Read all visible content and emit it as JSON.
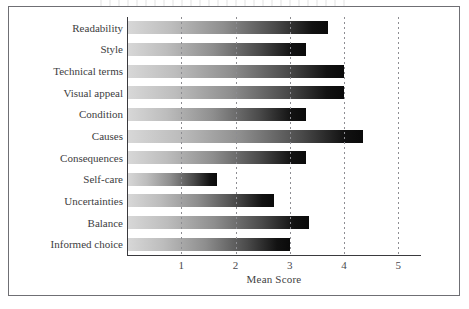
{
  "figure": {
    "has_outer_frame": true,
    "background_color": "#ffffff",
    "frame_color": "#6f6f74"
  },
  "chart_data": {
    "type": "bar",
    "orientation": "horizontal",
    "title": "",
    "xlabel": "Mean Score",
    "ylabel": "",
    "xlim": [
      0,
      5.4
    ],
    "xticks": [
      1,
      2,
      3,
      4,
      5
    ],
    "xtick_labels": [
      "1",
      "2",
      "3",
      "4",
      "5"
    ],
    "grid": "vertical-dotted",
    "legend": "none",
    "bar_style": "gradient light-grey to black, left to right",
    "categories": [
      "Readability",
      "Style",
      "Technical terms",
      "Visual appeal",
      "Condition",
      "Causes",
      "Consequences",
      "Self-care",
      "Uncertainties",
      "Balance",
      "Informed choice"
    ],
    "values": [
      3.7,
      3.3,
      4.0,
      4.0,
      3.3,
      4.35,
      3.3,
      1.65,
      2.7,
      3.35,
      3.0
    ]
  },
  "colors": {
    "bar_light": "#d8d8d8",
    "bar_dark": "#0a0a0a",
    "axis": "#3a3a3e",
    "grid": "#8d8d92",
    "text": "#3d3d41"
  }
}
